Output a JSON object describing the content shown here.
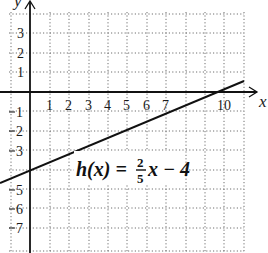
{
  "diagram": {
    "type": "coordinate-plane-line-graph",
    "x_axis_label": "x",
    "y_axis_label": "y",
    "x_ticks": [
      "1",
      "2",
      "3",
      "4",
      "5",
      "6",
      "7",
      "10"
    ],
    "y_ticks_positive": [
      "3",
      "2",
      "1"
    ],
    "y_ticks_negative": [
      "1",
      "2",
      "3",
      "5",
      "6",
      "7"
    ],
    "equation": {
      "lhs": "h(x) =",
      "frac_num": "2",
      "frac_den": "5",
      "rhs": "x − 4"
    },
    "line": {
      "slope": 0.4,
      "intercept": -4,
      "x_intercept": 10,
      "color": "#111111"
    },
    "grid": {
      "style": "dotted",
      "color": "#777777"
    }
  }
}
